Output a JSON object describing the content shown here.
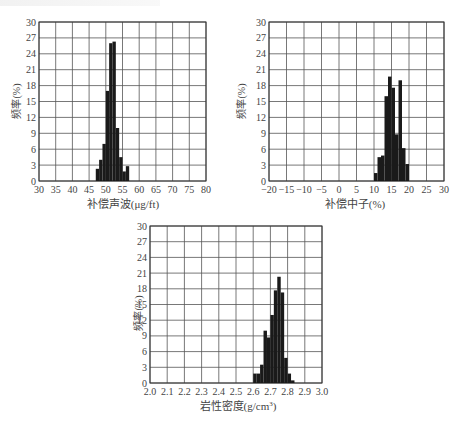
{
  "chart_data": [
    {
      "type": "bar",
      "title": "",
      "xlabel": "补偿声波(μg/ft)",
      "ylabel": "频率(%)",
      "xlim": [
        30,
        80
      ],
      "ylim": [
        0,
        30
      ],
      "xticks": [
        30,
        35,
        40,
        45,
        50,
        55,
        60,
        65,
        70,
        75,
        80
      ],
      "yticks": [
        0,
        3,
        6,
        9,
        12,
        15,
        18,
        21,
        24,
        27,
        30
      ],
      "grid": true,
      "bin_width": 1,
      "bins": [
        47,
        48,
        49,
        50,
        51,
        52,
        53,
        54,
        55,
        56
      ],
      "values": [
        2.3,
        4.0,
        7.0,
        17.0,
        26.0,
        26.3,
        10.0,
        4.5,
        1.8,
        2.8
      ]
    },
    {
      "type": "bar",
      "title": "",
      "xlabel": "补偿中子(%)",
      "ylabel": "频率(%)",
      "xlim": [
        -20,
        30
      ],
      "ylim": [
        0,
        30
      ],
      "xticks": [
        -20,
        -15,
        -10,
        -5,
        0,
        5,
        10,
        15,
        20,
        25,
        30
      ],
      "yticks": [
        0,
        3,
        6,
        9,
        12,
        15,
        18,
        21,
        24,
        27,
        30
      ],
      "grid": true,
      "bin_width": 1,
      "bins": [
        10,
        11,
        12,
        13,
        14,
        15,
        16,
        17,
        18,
        19
      ],
      "values": [
        1.5,
        4.5,
        4.8,
        16.0,
        19.7,
        17.6,
        8.8,
        19.0,
        6.2,
        3.2
      ]
    },
    {
      "type": "bar",
      "title": "",
      "xlabel": "岩性密度(g/cm³)",
      "ylabel": "频率(%)",
      "xlim": [
        2.0,
        3.0
      ],
      "ylim": [
        0,
        30
      ],
      "xticks": [
        2.0,
        2.1,
        2.2,
        2.3,
        2.4,
        2.5,
        2.6,
        2.7,
        2.8,
        2.9,
        3.0
      ],
      "yticks": [
        0,
        3,
        6,
        9,
        12,
        15,
        18,
        21,
        24,
        27,
        30
      ],
      "grid": true,
      "bin_width": 0.02,
      "bins": [
        2.6,
        2.62,
        2.64,
        2.66,
        2.68,
        2.7,
        2.72,
        2.74,
        2.76,
        2.78,
        2.8,
        2.82
      ],
      "values": [
        1.8,
        1.8,
        3.5,
        10.0,
        8.7,
        13.0,
        17.7,
        20.3,
        17.3,
        4.8,
        1.8,
        0.5
      ]
    }
  ],
  "charts": [
    {
      "ylabel": "频率(%)",
      "xlabel": "补偿声波(μg/ft)",
      "xtick_labels": [
        "30",
        "35",
        "40",
        "45",
        "50",
        "55",
        "60",
        "65",
        "70",
        "75",
        "80"
      ],
      "ytick_labels": [
        "0",
        "3",
        "6",
        "9",
        "12",
        "15",
        "18",
        "21",
        "24",
        "27",
        "30"
      ]
    },
    {
      "ylabel": "频率(%)",
      "xlabel": "补偿中子(%)",
      "xtick_labels": [
        "−20",
        "−15",
        "−10",
        "−5",
        "0",
        "5",
        "10",
        "15",
        "20",
        "25",
        "30"
      ],
      "ytick_labels": [
        "0",
        "3",
        "6",
        "9",
        "12",
        "15",
        "18",
        "21",
        "24",
        "27",
        "30"
      ]
    },
    {
      "ylabel": "频率(%)",
      "xlabel_main": "岩性密度(g/cm",
      "xlabel_sup": "3",
      "xlabel_end": ")",
      "xtick_labels": [
        "2.0",
        "2.1",
        "2.2",
        "2.3",
        "2.4",
        "2.5",
        "2.6",
        "2.7",
        "2.8",
        "2.9",
        "3.0"
      ],
      "ytick_labels": [
        "0",
        "3",
        "6",
        "9",
        "12",
        "15",
        "18",
        "21",
        "24",
        "27",
        "30"
      ]
    }
  ],
  "colors": {
    "bar": "#1a1a1a",
    "grid": "#555555",
    "text": "#444444"
  }
}
